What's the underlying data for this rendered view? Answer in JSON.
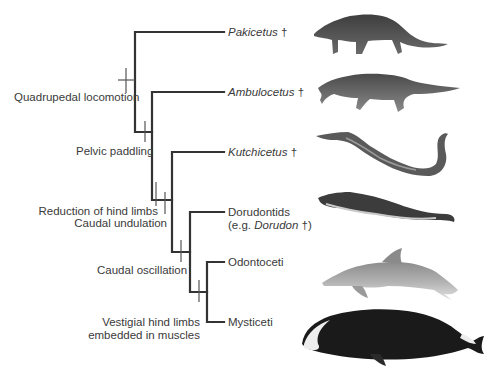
{
  "diagram": {
    "type": "cladogram",
    "colors": {
      "branch": "#333333",
      "tick": "#555555",
      "text": "#3a3a3a"
    },
    "taxa": [
      {
        "id": "pakicetus",
        "name": "Pakicetus",
        "suffix": " †",
        "italic": true,
        "image": "pakicetus-illustration"
      },
      {
        "id": "ambulocetus",
        "name": "Ambulocetus",
        "suffix": " †",
        "italic": true,
        "image": "ambulocetus-illustration"
      },
      {
        "id": "kutchicetus",
        "name": "Kutchicetus",
        "suffix": " †",
        "italic": true,
        "image": "kutchicetus-illustration"
      },
      {
        "id": "dorudontids",
        "name": "Dorudontids",
        "line2_prefix": "(e.g. ",
        "line2_italic": "Dorudon",
        "line2_suffix": " †)",
        "italic": false,
        "image": "dorudon-illustration"
      },
      {
        "id": "odontoceti",
        "name": "Odontoceti",
        "suffix": "",
        "italic": false,
        "image": "dolphin-illustration"
      },
      {
        "id": "mysticeti",
        "name": "Mysticeti",
        "suffix": "",
        "italic": false,
        "image": "bowhead-whale-illustration"
      }
    ],
    "characters": [
      {
        "id": "quadrupedal",
        "label": "Quadrupedal locomotion"
      },
      {
        "id": "pelvic",
        "label": "Pelvic paddling"
      },
      {
        "id": "reduction",
        "label": "Reduction of hind limbs"
      },
      {
        "id": "undulation",
        "label": "Caudal undulation"
      },
      {
        "id": "oscillation",
        "label": "Caudal oscillation"
      },
      {
        "id": "vestigial_1",
        "label": "Vestigial hind limbs"
      },
      {
        "id": "vestigial_2",
        "label": "embedded in muscles"
      }
    ]
  }
}
